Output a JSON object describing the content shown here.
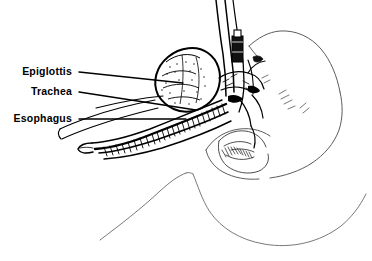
{
  "figure": {
    "medium": "black and white pen-and-ink line drawing",
    "background_color": "#ffffff",
    "ink_color": "#000000",
    "light_ink_color": "#555555"
  },
  "labels": [
    {
      "id": "epiglottis",
      "text": "Epiglottis",
      "text_x": 72,
      "text_y": 75,
      "leader_start_x": 79,
      "leader_start_y": 72,
      "leader_end_x": 183,
      "leader_end_y": 83
    },
    {
      "id": "trachea",
      "text": "Trachea",
      "text_x": 72,
      "text_y": 95,
      "leader_start_x": 79,
      "leader_start_y": 92,
      "leader_end_x": 196,
      "leader_end_y": 110
    },
    {
      "id": "esophagus",
      "text": "Esophagus",
      "text_x": 72,
      "text_y": 122,
      "leader_start_x": 79,
      "leader_start_y": 119,
      "leader_end_x": 186,
      "leader_end_y": 119
    }
  ],
  "anatomy": {
    "tongue": "tongue-mass",
    "airway": "trachea-esophagus-passage",
    "head": "head-profile-contour",
    "jaw": "jaw-and-mouth",
    "shoulder": "shoulder-chest-contour"
  },
  "instruments": {
    "endotracheal_tube": "endotracheal-tube",
    "tube_connector": "tube-connector",
    "laryngoscope_blade": "laryngoscope-blade"
  }
}
